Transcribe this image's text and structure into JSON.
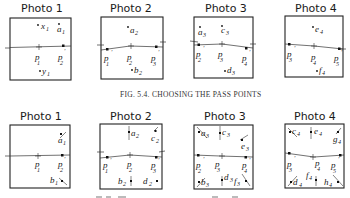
{
  "figure_top": {
    "caption": "FIG. 5.4. CHOOSING THE PASS POINTS",
    "photos": [
      {
        "title": "Photo 1",
        "points": [
          "x1",
          "a1",
          "p1",
          "p'2",
          "y1"
        ]
      },
      {
        "title": "Photo 2",
        "points": [
          "a2",
          "p'1",
          "p2",
          "p'3",
          "b2"
        ]
      },
      {
        "title": "Photo 3",
        "points": [
          "a3",
          "c3",
          "p'2",
          "p3",
          "p'4",
          "d3"
        ]
      },
      {
        "title": "Photo 4",
        "points": [
          "e4",
          "p'3",
          "p4",
          "p'5",
          "f4"
        ]
      }
    ]
  },
  "figure_bottom": {
    "photos": [
      {
        "title": "Photo 1",
        "points": [
          "a1",
          "p1",
          "p'2",
          "b1"
        ]
      },
      {
        "title": "Photo 2",
        "points": [
          "a2",
          "c2",
          "p'1",
          "p2",
          "p'3",
          "b2",
          "d2"
        ]
      },
      {
        "title": "Photo 3",
        "points": [
          "a3",
          "c3",
          "e3",
          "p'2",
          "p3",
          "p'4",
          "b3",
          "d3",
          "f3"
        ]
      },
      {
        "title": "Photo 4",
        "points": [
          "c4",
          "e4",
          "g4",
          "p'3",
          "p4",
          "p'5",
          "d4",
          "f4",
          "h4"
        ]
      }
    ]
  }
}
